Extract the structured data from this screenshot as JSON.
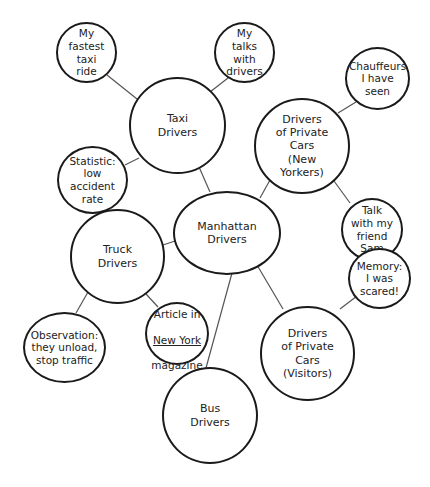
{
  "diagram": {
    "type": "cluster-map",
    "center": {
      "id": "manhattan",
      "label": "Manhattan\nDrivers"
    },
    "nodes": {
      "taxi": {
        "label": "Taxi\nDrivers"
      },
      "fastest": {
        "label": "My\nfastest\ntaxi\nride"
      },
      "talks": {
        "label": "My\ntalks\nwith\ndrivers"
      },
      "statistic": {
        "label": "Statistic:\nlow\naccident\nrate"
      },
      "private_ny": {
        "label": "Drivers\nof Private\nCars\n(New\nYorkers)"
      },
      "chauffeurs": {
        "label": "Chauffeurs\nI have\nseen"
      },
      "sam": {
        "label": "Talk\nwith my\nfriend\nSam"
      },
      "truck": {
        "label": "Truck\nDrivers"
      },
      "observation": {
        "label": "Observation:\nthey unload,\nstop traffic"
      },
      "article": {
        "line1": "Article in",
        "line2": "New York",
        "line3": "magazine"
      },
      "private_visitors": {
        "label": "Drivers\nof Private\nCars\n(Visitors)"
      },
      "memory": {
        "label": "Memory:\nI was\nscared!"
      },
      "bus": {
        "label": "Bus\nDrivers"
      }
    },
    "edges": [
      [
        "manhattan",
        "taxi"
      ],
      [
        "manhattan",
        "private_ny"
      ],
      [
        "manhattan",
        "truck"
      ],
      [
        "manhattan",
        "private_visitors"
      ],
      [
        "manhattan",
        "bus"
      ],
      [
        "taxi",
        "fastest"
      ],
      [
        "taxi",
        "talks"
      ],
      [
        "taxi",
        "statistic"
      ],
      [
        "private_ny",
        "chauffeurs"
      ],
      [
        "private_ny",
        "sam"
      ],
      [
        "truck",
        "observation"
      ],
      [
        "truck",
        "article"
      ],
      [
        "private_visitors",
        "memory"
      ]
    ]
  }
}
